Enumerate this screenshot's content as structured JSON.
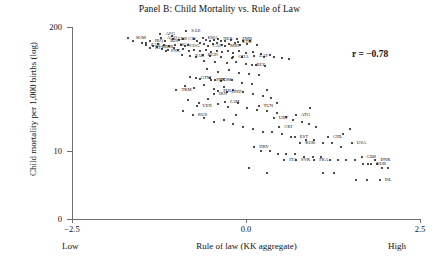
{
  "chart_data": {
    "type": "scatter",
    "title": "Panel B: Child Mortality vs. Rule of Law",
    "xlabel": "Rule of law (KK aggregate)",
    "ylabel": "Child mortality per 1,000 births (log)",
    "xlim": [
      -2.5,
      2.5
    ],
    "ylim": [
      0,
      200
    ],
    "yscale": "log-style",
    "grid": false,
    "legend": null,
    "annotations": [
      {
        "name": "correlation",
        "text": "r = −0.78",
        "x": 1.85,
        "y": 150
      }
    ],
    "xticks": [
      {
        "value": -2.5,
        "label": "−2.5"
      },
      {
        "value": 0.0,
        "label": "0.0"
      },
      {
        "value": 2.5,
        "label": "2.5"
      }
    ],
    "yticks": [
      {
        "value": 200,
        "label": "200"
      },
      {
        "value": 10,
        "label": "10"
      },
      {
        "value": 0,
        "label": "0"
      }
    ],
    "x_end_labels": {
      "low": "Low",
      "high": "High"
    },
    "points": [
      {
        "label": "SOM",
        "x": -1.7,
        "y": 152,
        "lx": 8,
        "ly": 0
      },
      {
        "label": "AFG",
        "x": -1.24,
        "y": 168,
        "lx": 6,
        "ly": 0
      },
      {
        "label": "S.LE",
        "x": -0.86,
        "y": 182,
        "lx": 5,
        "ly": 0
      },
      {
        "label": "AGO",
        "x": -1.22,
        "y": 155,
        "lx": 6,
        "ly": 0
      },
      {
        "label": "IRQ",
        "x": -1.38,
        "y": 142,
        "lx": 5,
        "ly": 0
      },
      {
        "label": "BDI",
        "x": -1.16,
        "y": 142,
        "lx": 5,
        "ly": 0
      },
      {
        "label": "LBR",
        "x": -1.05,
        "y": 150,
        "lx": 5,
        "ly": 0
      },
      {
        "label": "CIV",
        "x": -0.9,
        "y": 149,
        "lx": 5,
        "ly": 0
      },
      {
        "label": "RWA",
        "x": -0.62,
        "y": 155,
        "lx": 5,
        "ly": 0
      },
      {
        "label": "NER",
        "x": -0.4,
        "y": 150,
        "lx": 5,
        "ly": 0
      },
      {
        "label": "ZMB",
        "x": -0.13,
        "y": 150,
        "lx": 5,
        "ly": 0
      },
      {
        "label": "ETH",
        "x": -0.12,
        "y": 140,
        "lx": 5,
        "ly": 0
      },
      {
        "label": "ZAR",
        "x": -1.44,
        "y": 129,
        "lx": 5,
        "ly": 0
      },
      {
        "label": "MMR",
        "x": -1.28,
        "y": 122,
        "lx": 5,
        "ly": 0
      },
      {
        "label": "HTI",
        "x": -1.38,
        "y": 120,
        "lx": 5,
        "ly": 0
      },
      {
        "label": "NGA",
        "x": -1.02,
        "y": 128,
        "lx": 5,
        "ly": 0
      },
      {
        "label": "COG",
        "x": -0.88,
        "y": 125,
        "lx": 5,
        "ly": 0
      },
      {
        "label": "CAF",
        "x": -0.55,
        "y": 126,
        "lx": 5,
        "ly": 0
      },
      {
        "label": "MRT",
        "x": -0.3,
        "y": 126,
        "lx": 5,
        "ly": 0
      },
      {
        "label": "PNG",
        "x": -1.15,
        "y": 112,
        "lx": 5,
        "ly": 0
      },
      {
        "label": "PAK",
        "x": -0.8,
        "y": 100,
        "lx": 5,
        "ly": 0
      },
      {
        "label": "BGD",
        "x": -0.62,
        "y": 102,
        "lx": 5,
        "ly": 0
      },
      {
        "label": "GHA",
        "x": -0.18,
        "y": 98,
        "lx": 5,
        "ly": 0
      },
      {
        "label": "ZAF",
        "x": 0.12,
        "y": 100,
        "lx": 5,
        "ly": 0
      },
      {
        "label": "BLY",
        "x": 0.08,
        "y": 80,
        "lx": 5,
        "ly": 0
      },
      {
        "label": "GTM",
        "x": -0.72,
        "y": 58,
        "lx": 5,
        "ly": 0
      },
      {
        "label": "TKM",
        "x": -1.0,
        "y": 44,
        "lx": 5,
        "ly": 0
      },
      {
        "label": "PRK",
        "x": -0.5,
        "y": 55,
        "lx": 5,
        "ly": 0
      },
      {
        "label": "DOM",
        "x": -0.44,
        "y": 56,
        "lx": 5,
        "ly": 0
      },
      {
        "label": "IRN",
        "x": -0.46,
        "y": 40,
        "lx": 5,
        "ly": 0
      },
      {
        "label": "PHL",
        "x": -0.4,
        "y": 43,
        "lx": 5,
        "ly": 0
      },
      {
        "label": "HND",
        "x": -0.28,
        "y": 42,
        "lx": 5,
        "ly": 0
      },
      {
        "label": "JAM",
        "x": -0.3,
        "y": 33,
        "lx": 5,
        "ly": 0
      },
      {
        "label": "VEN",
        "x": -0.7,
        "y": 30,
        "lx": 5,
        "ly": 0
      },
      {
        "label": "RUS",
        "x": -0.76,
        "y": 24,
        "lx": 5,
        "ly": 0
      },
      {
        "label": "TUN",
        "x": 0.18,
        "y": 30,
        "lx": 5,
        "ly": 0
      },
      {
        "label": "ATG",
        "x": 0.72,
        "y": 24,
        "lx": 5,
        "ly": 0
      },
      {
        "label": "URY",
        "x": 0.4,
        "y": 22,
        "lx": 5,
        "ly": 0
      },
      {
        "label": "CRI",
        "x": 0.48,
        "y": 18,
        "lx": 5,
        "ly": 0
      },
      {
        "label": "EST",
        "x": 0.7,
        "y": 14,
        "lx": 5,
        "ly": 0
      },
      {
        "label": "KOR",
        "x": 0.78,
        "y": 12,
        "lx": 5,
        "ly": 0
      },
      {
        "label": "CHL",
        "x": 1.18,
        "y": 14,
        "lx": 5,
        "ly": 0
      },
      {
        "label": "HRV",
        "x": 0.12,
        "y": 11,
        "lx": 5,
        "ly": 0
      },
      {
        "label": "SVK",
        "x": 0.72,
        "y": 7,
        "lx": 5,
        "ly": 0
      },
      {
        "label": "FRA",
        "x": 0.98,
        "y": 7,
        "lx": 5,
        "ly": 0
      },
      {
        "label": "ITA",
        "x": 0.55,
        "y": 7,
        "lx": 5,
        "ly": 0
      },
      {
        "label": "USA",
        "x": 1.52,
        "y": 12,
        "lx": 5,
        "ly": 0
      },
      {
        "label": "GBR",
        "x": 1.66,
        "y": 8,
        "lx": 5,
        "ly": 0
      },
      {
        "label": "DNK",
        "x": 1.86,
        "y": 7,
        "lx": 5,
        "ly": 0
      },
      {
        "label": "NOR",
        "x": 1.8,
        "y": 6,
        "lx": 5,
        "ly": 0
      },
      {
        "label": "ISL",
        "x": 1.92,
        "y": 3,
        "lx": 5,
        "ly": 0
      }
    ],
    "unlabeled_points": [
      [
        -1.62,
        143
      ],
      [
        -1.06,
        160
      ],
      [
        -0.96,
        145
      ],
      [
        -0.75,
        148
      ],
      [
        -0.7,
        143
      ],
      [
        -0.58,
        147
      ],
      [
        -0.52,
        141
      ],
      [
        -0.46,
        146
      ],
      [
        -0.36,
        141
      ],
      [
        -0.3,
        144
      ],
      [
        -0.22,
        146
      ],
      [
        -0.04,
        143
      ],
      [
        0.06,
        141
      ],
      [
        -0.66,
        137
      ],
      [
        -0.6,
        134
      ],
      [
        -0.48,
        133
      ],
      [
        -0.42,
        136
      ],
      [
        -0.34,
        131
      ],
      [
        -0.24,
        133
      ],
      [
        -0.16,
        135
      ],
      [
        -0.08,
        130
      ],
      [
        0.02,
        132
      ],
      [
        0.16,
        129
      ],
      [
        -0.94,
        131
      ],
      [
        -0.84,
        129
      ],
      [
        -1.1,
        126
      ],
      [
        -1.18,
        130
      ],
      [
        -1.26,
        133
      ],
      [
        -1.34,
        127
      ],
      [
        -1.44,
        137
      ],
      [
        -1.5,
        136
      ],
      [
        -1.2,
        118
      ],
      [
        -1.12,
        116
      ],
      [
        -1.04,
        119
      ],
      [
        -0.98,
        114
      ],
      [
        -0.9,
        117
      ],
      [
        -0.82,
        113
      ],
      [
        -0.74,
        116
      ],
      [
        -0.66,
        112
      ],
      [
        -0.58,
        115
      ],
      [
        -0.5,
        110
      ],
      [
        -0.42,
        113
      ],
      [
        -0.34,
        109
      ],
      [
        -0.26,
        112
      ],
      [
        -0.18,
        108
      ],
      [
        -0.1,
        111
      ],
      [
        0.0,
        107
      ],
      [
        0.1,
        110
      ],
      [
        0.22,
        104
      ],
      [
        0.34,
        102
      ],
      [
        -0.92,
        101
      ],
      [
        -0.72,
        97
      ],
      [
        -0.52,
        99
      ],
      [
        -0.36,
        96
      ],
      [
        -0.2,
        95
      ],
      [
        -0.06,
        97
      ],
      [
        0.26,
        98
      ],
      [
        0.4,
        96
      ],
      [
        0.52,
        94
      ],
      [
        0.62,
        93
      ],
      [
        -0.6,
        88
      ],
      [
        -0.44,
        85
      ],
      [
        -0.28,
        83
      ],
      [
        -0.14,
        86
      ],
      [
        0.0,
        82
      ],
      [
        0.14,
        80
      ],
      [
        0.28,
        78
      ],
      [
        -0.56,
        72
      ],
      [
        -0.4,
        68
      ],
      [
        -0.24,
        70
      ],
      [
        -0.1,
        66
      ],
      [
        0.04,
        64
      ],
      [
        0.18,
        62
      ],
      [
        -0.8,
        60
      ],
      [
        -0.66,
        57
      ],
      [
        -0.52,
        59
      ],
      [
        -0.36,
        54
      ],
      [
        -0.2,
        56
      ],
      [
        -0.06,
        52
      ],
      [
        0.08,
        50
      ],
      [
        -0.88,
        48
      ],
      [
        -0.74,
        46
      ],
      [
        -0.6,
        49
      ],
      [
        -0.46,
        45
      ],
      [
        -0.32,
        47
      ],
      [
        -0.18,
        44
      ],
      [
        -0.04,
        42
      ],
      [
        0.1,
        40
      ],
      [
        0.24,
        38
      ],
      [
        0.36,
        36
      ],
      [
        -0.84,
        34
      ],
      [
        -0.68,
        32
      ],
      [
        -0.54,
        35
      ],
      [
        -0.4,
        31
      ],
      [
        -0.26,
        29
      ],
      [
        -0.12,
        32
      ],
      [
        0.02,
        28
      ],
      [
        0.16,
        27
      ],
      [
        0.3,
        26
      ],
      [
        0.44,
        25
      ],
      [
        0.58,
        23
      ],
      [
        0.68,
        21
      ],
      [
        0.8,
        20
      ],
      [
        0.9,
        19
      ],
      [
        1.0,
        18
      ],
      [
        -0.6,
        22
      ],
      [
        -0.46,
        20
      ],
      [
        -0.32,
        21
      ],
      [
        -0.18,
        19
      ],
      [
        -0.04,
        18
      ],
      [
        0.1,
        17
      ],
      [
        0.24,
        16
      ],
      [
        0.38,
        16
      ],
      [
        0.52,
        15
      ],
      [
        0.64,
        14
      ],
      [
        0.86,
        13
      ],
      [
        0.98,
        13
      ],
      [
        1.1,
        12
      ],
      [
        1.24,
        12
      ],
      [
        1.36,
        11
      ],
      [
        0.22,
        10
      ],
      [
        0.34,
        10
      ],
      [
        0.46,
        9
      ],
      [
        0.58,
        9
      ],
      [
        0.7,
        9
      ],
      [
        0.84,
        8
      ],
      [
        0.96,
        8
      ],
      [
        1.08,
        8
      ],
      [
        1.2,
        7
      ],
      [
        1.32,
        7
      ],
      [
        1.44,
        7
      ],
      [
        1.56,
        7
      ],
      [
        1.68,
        6
      ],
      [
        1.76,
        6
      ],
      [
        1.88,
        6
      ],
      [
        1.96,
        5
      ],
      [
        2.04,
        5
      ],
      [
        0.04,
        5
      ],
      [
        0.3,
        4
      ],
      [
        1.1,
        4
      ],
      [
        1.26,
        4
      ],
      [
        1.58,
        3
      ],
      [
        1.74,
        3
      ],
      [
        -0.14,
        24
      ],
      [
        -0.9,
        26
      ],
      [
        0.44,
        32
      ],
      [
        0.3,
        44
      ],
      [
        1.4,
        15
      ],
      [
        1.5,
        17
      ],
      [
        0.92,
        28
      ]
    ]
  }
}
